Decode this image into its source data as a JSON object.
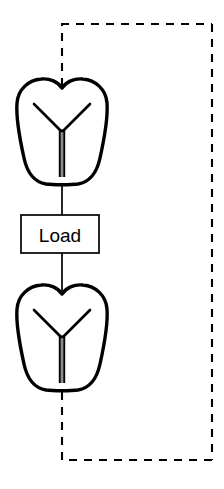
{
  "diagram": {
    "title": "",
    "background_color": "#ffffff",
    "stroke_color": "#000000",
    "nodes": [
      {
        "id": "antibody-top",
        "type": "antibody-shield",
        "label": "",
        "cx": 62,
        "cy": 134,
        "width": 92,
        "height": 104
      },
      {
        "id": "load-box",
        "type": "process-box",
        "label": "Load",
        "x": 21,
        "y": 215,
        "width": 78,
        "height": 38
      },
      {
        "id": "antibody-bottom",
        "type": "antibody-shield",
        "label": "",
        "cx": 62,
        "cy": 340,
        "width": 92,
        "height": 104
      }
    ],
    "edges": [
      {
        "id": "edge-top-to-load",
        "from": "antibody-top",
        "to": "load-box",
        "style": "solid",
        "label": ""
      },
      {
        "id": "edge-load-to-bottom",
        "from": "load-box",
        "to": "antibody-bottom",
        "style": "solid",
        "label": ""
      },
      {
        "id": "feedback-loop",
        "from": "antibody-bottom",
        "to": "antibody-top",
        "style": "dashed",
        "label": ""
      }
    ],
    "feedback_path": {
      "style": "dashed",
      "left_x": 62,
      "right_x": 212,
      "top_y": 24,
      "bottom_y": 460,
      "dash_pattern": "8 7"
    },
    "icons": {
      "antibody": "antibody-y-icon",
      "shield": "shield-outline-icon"
    }
  }
}
